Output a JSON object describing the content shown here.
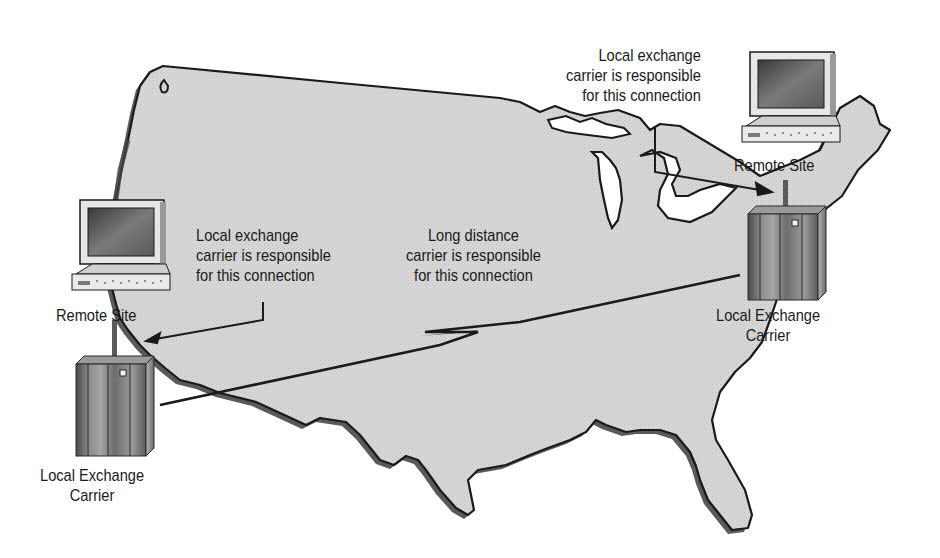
{
  "diagram": {
    "type": "network-topology",
    "background": "#ffffff",
    "map": {
      "region": "continental-us",
      "fill": "#d4d4d4",
      "outline": "#1a1a1a",
      "shadow": "#5a5a5a"
    },
    "nodes": [
      {
        "id": "remote-site-west",
        "label": "Remote Site",
        "kind": "computer"
      },
      {
        "id": "lec-west",
        "label": [
          "Local Exchange",
          "Carrier"
        ],
        "kind": "switch"
      },
      {
        "id": "remote-site-east",
        "label": "Remote Site",
        "kind": "computer"
      },
      {
        "id": "lec-east",
        "label": [
          "Local Exchange",
          "Carrier"
        ],
        "kind": "switch"
      }
    ],
    "callouts": {
      "west_local": [
        "Local exchange",
        "carrier is responsible",
        "for this connection"
      ],
      "long_distance": [
        "Long distance",
        "carrier is responsible",
        "for this connection"
      ],
      "east_local": [
        "Local exchange",
        "carrier is responsible",
        "for this connection"
      ]
    },
    "edges": [
      {
        "from": "remote-site-west",
        "to": "lec-west",
        "style": "short-link"
      },
      {
        "from": "lec-west",
        "to": "lec-east",
        "style": "lightning-wan"
      },
      {
        "from": "remote-site-east",
        "to": "lec-east",
        "style": "short-link"
      }
    ]
  }
}
